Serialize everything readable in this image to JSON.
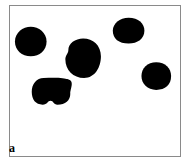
{
  "figure": {
    "panel_label": "a",
    "label_position": "bottom-left",
    "background_color": "#ffffff",
    "frame_color": "#8a8a8a",
    "blob_color": "#000000",
    "object_count": 5,
    "image_type": "binary-threshold"
  },
  "chart_data": {
    "type": "scatter",
    "title": "a",
    "subtitle": "",
    "xlabel": "",
    "ylabel": "",
    "xlim": [
      0,
      172
    ],
    "ylim": [
      0,
      152
    ],
    "grid": false,
    "legend_position": "none",
    "categories": [
      "blob-1",
      "blob-2",
      "blob-3",
      "blob-4",
      "blob-5"
    ],
    "values": [
      735,
      980,
      690,
      700,
      900
    ],
    "annotations": [
      "a"
    ],
    "series": [
      {
        "name": "black-objects",
        "values": [
          735,
          980,
          690,
          700,
          900
        ]
      }
    ],
    "objects": [
      {
        "id": "blob-1",
        "name": "blob-top-left",
        "cx": 21,
        "cy": 36,
        "rx": 16,
        "ry": 15,
        "area": 735,
        "path": "M 21 21 C 29 21 37 27 37 36 C 37 45 30 51 21 51 C 12 51 5 45 5 36 C 5 27 13 21 21 21 Z"
      },
      {
        "id": "blob-2",
        "name": "blob-center",
        "cx": 74,
        "cy": 53,
        "rx": 17,
        "ry": 20,
        "area": 980,
        "path": "M 74 33 C 84 33 92 40 92 51 C 92 62 86 73 75 73 C 64 73 56 65 56 54 C 56 50 59 48 59 45 C 59 38 66 33 74 33 Z"
      },
      {
        "id": "blob-3",
        "name": "blob-top-right",
        "cx": 120,
        "cy": 25,
        "rx": 16,
        "ry": 13,
        "area": 690,
        "path": "M 120 12 C 130 12 136 18 136 25 C 136 33 129 38 120 38 C 110 38 104 33 104 25 C 104 18 111 12 120 12 Z"
      },
      {
        "id": "blob-4",
        "name": "blob-right",
        "cx": 148,
        "cy": 71,
        "rx": 15,
        "ry": 14,
        "area": 700,
        "path": "M 148 57 C 157 57 163 63 163 71 C 163 80 157 85 148 85 C 139 85 133 79 133 71 C 133 63 139 57 148 57 Z"
      },
      {
        "id": "blob-5",
        "name": "blob-bottom-left",
        "cx": 42,
        "cy": 87,
        "rx": 19,
        "ry": 14,
        "area": 900,
        "path": "M 34 73 C 46 72 56 73 58 74 C 66 76 61 83 61 89 C 61 96 56 100 48 100 C 44 100 44 96 41 96 C 38 96 38 100 33 100 C 26 100 22 95 22 87 C 22 79 27 73 34 73 Z"
      }
    ]
  }
}
